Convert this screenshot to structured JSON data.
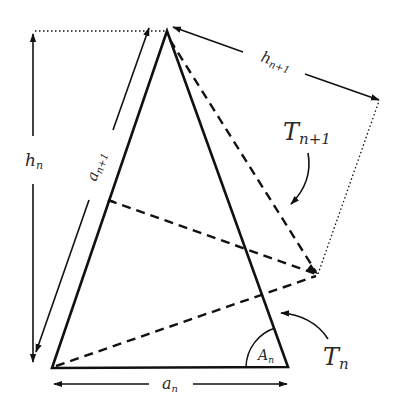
{
  "diagram": {
    "colors": {
      "stroke": "#111111",
      "background": "#ffffff",
      "text": "#2a2a2a"
    },
    "labels": {
      "h_n": {
        "main": "h",
        "sub": "n"
      },
      "a_n1": {
        "main": "a",
        "sub": "n+1"
      },
      "h_n1": {
        "main": "h",
        "sub": "n+1"
      },
      "a_n": {
        "main": "a",
        "sub": "n"
      },
      "A_n": {
        "main": "A",
        "sub": "n"
      },
      "T_n1": {
        "main": "T",
        "sub": "n+1"
      },
      "T_n": {
        "main": "T",
        "sub": "n"
      }
    },
    "points": {
      "apex": [
        167,
        31
      ],
      "bottom_left": [
        52,
        368
      ],
      "bottom_right": [
        288,
        367
      ],
      "right_vertex": [
        318,
        274
      ],
      "far_right": [
        379,
        101
      ],
      "side_point": [
        107,
        200
      ]
    },
    "elements": [
      "triangle T_n (solid)",
      "triangle T_{n+1} (dashed)",
      "height h_n (vertical double arrow)",
      "height h_{n+1} (slanted double arrow)",
      "base a_n (horizontal double arrow)",
      "side a_{n+1} (slanted double arrow)",
      "angle A_n at bottom-right vertex"
    ]
  }
}
